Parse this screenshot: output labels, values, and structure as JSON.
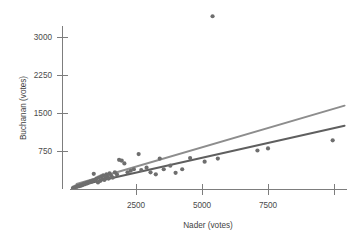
{
  "chart_data": {
    "type": "scatter",
    "title": "",
    "subtitle": "",
    "xlabel": "Nader (votes)",
    "ylabel": "Buchanan (votes)",
    "xlim": [
      0,
      10450
    ],
    "ylim": [
      0,
      3500
    ],
    "xticks": [
      2500,
      5000,
      7500,
      10000
    ],
    "xtick_labels": [
      "2500",
      "5000",
      "7500",
      ""
    ],
    "yticks": [
      750,
      1500,
      2250,
      3000
    ],
    "ytick_labels": [
      "750",
      "1500",
      "2250",
      "3000"
    ],
    "grid": false,
    "legend": "none",
    "point_color": "#6e6e6e",
    "point_radius": 2.1,
    "series": [
      {
        "name": "Florida counties",
        "points": [
          [
            110,
            20
          ],
          [
            150,
            35
          ],
          [
            190,
            28
          ],
          [
            230,
            50
          ],
          [
            270,
            42
          ],
          [
            310,
            60
          ],
          [
            350,
            55
          ],
          [
            390,
            75
          ],
          [
            430,
            68
          ],
          [
            470,
            90
          ],
          [
            500,
            82
          ],
          [
            540,
            105
          ],
          [
            580,
            98
          ],
          [
            620,
            120
          ],
          [
            660,
            112
          ],
          [
            700,
            135
          ],
          [
            740,
            128
          ],
          [
            780,
            150
          ],
          [
            820,
            143
          ],
          [
            860,
            165
          ],
          [
            900,
            300
          ],
          [
            940,
            175
          ],
          [
            980,
            190
          ],
          [
            1020,
            210
          ],
          [
            1060,
            128
          ],
          [
            1100,
            230
          ],
          [
            1140,
            160
          ],
          [
            1180,
            250
          ],
          [
            1220,
            195
          ],
          [
            1260,
            270
          ],
          [
            1300,
            180
          ],
          [
            1340,
            215
          ],
          [
            1380,
            290
          ],
          [
            1420,
            240
          ],
          [
            1460,
            205
          ],
          [
            1500,
            310
          ],
          [
            1560,
            260
          ],
          [
            1620,
            225
          ],
          [
            1700,
            330
          ],
          [
            1780,
            285
          ],
          [
            1860,
            575
          ],
          [
            1960,
            560
          ],
          [
            2060,
            505
          ],
          [
            2180,
            330
          ],
          [
            2300,
            360
          ],
          [
            2420,
            390
          ],
          [
            2600,
            690
          ],
          [
            2700,
            375
          ],
          [
            2900,
            420
          ],
          [
            3050,
            330
          ],
          [
            3250,
            290
          ],
          [
            3400,
            600
          ],
          [
            3550,
            390
          ],
          [
            3800,
            460
          ],
          [
            4000,
            320
          ],
          [
            4250,
            390
          ],
          [
            4550,
            610
          ],
          [
            5100,
            540
          ],
          [
            5400,
            3410
          ],
          [
            5600,
            600
          ],
          [
            7100,
            760
          ],
          [
            7500,
            800
          ],
          [
            9950,
            960
          ]
        ]
      }
    ],
    "fit_lines": [
      {
        "name": "regression-with-outlier",
        "color": "#8d8d8d",
        "width": 2.0,
        "x0": 250,
        "y0": 100,
        "x1": 10400,
        "y1": 1645
      },
      {
        "name": "regression-without-outlier",
        "color": "#5f5f5f",
        "width": 2.0,
        "x0": 250,
        "y0": 60,
        "x1": 10400,
        "y1": 1250
      }
    ]
  },
  "axes": {
    "x_axis_name": "nader-votes-axis",
    "y_axis_name": "buchanan-votes-axis"
  }
}
